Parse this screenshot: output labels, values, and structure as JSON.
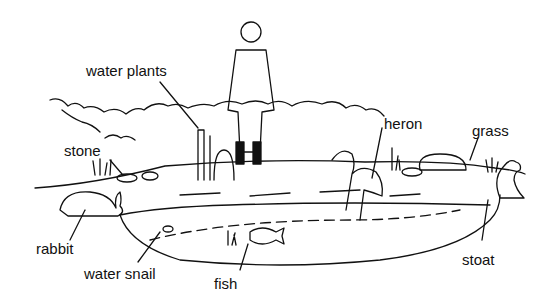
{
  "diagram": {
    "labels": {
      "water_plants": "water plants",
      "stone": "stone",
      "heron": "heron",
      "grass": "grass",
      "rabbit": "rabbit",
      "water_snail": "water snail",
      "fish": "fish",
      "stoat": "stoat"
    },
    "colors": {
      "ink": "#111111",
      "background": "#ffffff"
    }
  }
}
